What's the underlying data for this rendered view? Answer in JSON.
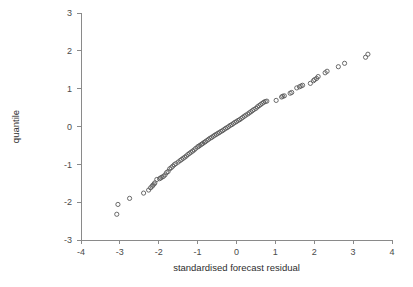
{
  "chart_data": {
    "type": "scatter",
    "title": "",
    "subtitle": "",
    "xlabel": "standardised forecast residual",
    "ylabel": "quantile",
    "xlim": [
      -4,
      4
    ],
    "ylim": [
      -3,
      3
    ],
    "xticks": [
      -4,
      -3,
      -2,
      -1,
      0,
      1,
      2,
      3,
      4
    ],
    "xtick_labels": [
      "-4",
      "-3",
      "-2",
      "-1",
      "0",
      "1",
      "2",
      "3",
      "4"
    ],
    "yticks": [
      -3,
      -2,
      -1,
      0,
      1,
      2,
      3
    ],
    "ytick_labels": [
      "-3",
      "-2",
      "-1",
      "0",
      "1",
      "2",
      "3"
    ],
    "grid": false,
    "legend": "none",
    "marker": "open-circle",
    "marker_size": 2.1,
    "marker_color": "#5a5a5a",
    "axis_color": "#8a8a8a",
    "background": "#ffffff",
    "n_points": 101,
    "x": [
      -3.08,
      -3.05,
      -2.75,
      -2.39,
      -2.26,
      -2.21,
      -2.17,
      -2.15,
      -2.12,
      -2.1,
      -2.05,
      -1.98,
      -1.95,
      -1.92,
      -1.88,
      -1.84,
      -1.8,
      -1.76,
      -1.72,
      -1.68,
      -1.64,
      -1.6,
      -1.56,
      -1.5,
      -1.45,
      -1.41,
      -1.37,
      -1.33,
      -1.29,
      -1.25,
      -1.21,
      -1.17,
      -1.13,
      -1.09,
      -1.05,
      -1.0,
      -0.97,
      -0.94,
      -0.9,
      -0.87,
      -0.83,
      -0.8,
      -0.76,
      -0.72,
      -0.68,
      -0.64,
      -0.6,
      -0.56,
      -0.52,
      -0.48,
      -0.44,
      -0.4,
      -0.36,
      -0.32,
      -0.28,
      -0.24,
      -0.2,
      -0.16,
      -0.12,
      -0.08,
      -0.04,
      0.0,
      0.04,
      0.08,
      0.12,
      0.16,
      0.2,
      0.24,
      0.29,
      0.33,
      0.37,
      0.41,
      0.45,
      0.5,
      0.54,
      0.58,
      0.62,
      0.66,
      0.7,
      0.74,
      0.78,
      1.02,
      1.16,
      1.19,
      1.23,
      1.38,
      1.42,
      1.55,
      1.62,
      1.66,
      1.7,
      1.9,
      1.98,
      2.01,
      2.06,
      2.1,
      2.28,
      2.33,
      2.62,
      2.78,
      3.32,
      3.38
    ],
    "y": [
      -2.32,
      -2.06,
      -1.9,
      -1.76,
      -1.68,
      -1.62,
      -1.58,
      -1.55,
      -1.52,
      -1.49,
      -1.4,
      -1.38,
      -1.36,
      -1.34,
      -1.32,
      -1.28,
      -1.22,
      -1.19,
      -1.12,
      -1.09,
      -1.05,
      -1.01,
      -0.98,
      -0.94,
      -0.9,
      -0.87,
      -0.84,
      -0.81,
      -0.78,
      -0.74,
      -0.71,
      -0.68,
      -0.65,
      -0.62,
      -0.58,
      -0.54,
      -0.52,
      -0.5,
      -0.47,
      -0.45,
      -0.42,
      -0.4,
      -0.37,
      -0.34,
      -0.31,
      -0.29,
      -0.26,
      -0.23,
      -0.21,
      -0.18,
      -0.16,
      -0.13,
      -0.11,
      -0.08,
      -0.05,
      -0.03,
      0.0,
      0.03,
      0.05,
      0.08,
      0.11,
      0.13,
      0.16,
      0.18,
      0.21,
      0.24,
      0.27,
      0.3,
      0.33,
      0.36,
      0.39,
      0.42,
      0.45,
      0.48,
      0.52,
      0.55,
      0.58,
      0.61,
      0.64,
      0.66,
      0.67,
      0.69,
      0.78,
      0.8,
      0.81,
      0.88,
      0.9,
      1.02,
      1.05,
      1.07,
      1.09,
      1.14,
      1.21,
      1.24,
      1.27,
      1.32,
      1.42,
      1.46,
      1.58,
      1.67,
      1.83,
      1.91
    ]
  }
}
